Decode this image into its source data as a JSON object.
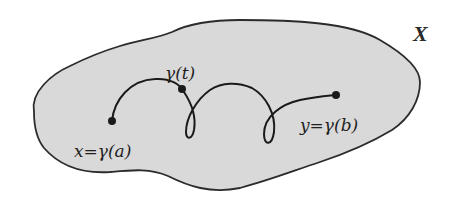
{
  "diagram": {
    "space_label": "X",
    "point_labels": {
      "start": "x=γ(a)",
      "middle": "γ(t)",
      "end": "y=γ(b)"
    },
    "colors": {
      "region_fill": "#d9d9d9",
      "region_stroke": "#2b2b2b",
      "path_stroke": "#1a1a1a",
      "point_fill": "#1a1a1a",
      "background": "#ffffff"
    }
  }
}
